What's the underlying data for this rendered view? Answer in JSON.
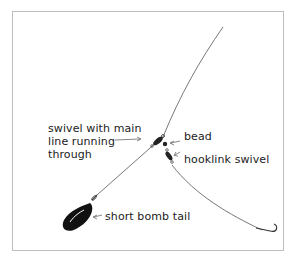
{
  "diagram": {
    "type": "fishing-rig-illustration",
    "labels": {
      "swivel_line1": "swivel with main",
      "swivel_line2": "line running",
      "swivel_line3": "through",
      "bead": "bead",
      "hooklink_swivel": "hooklink swivel",
      "short_bomb_tail": "short bomb tail"
    },
    "colors": {
      "line": "#444444",
      "lead": "#111111",
      "frame": "#bdbdbd",
      "text": "#222222"
    }
  }
}
